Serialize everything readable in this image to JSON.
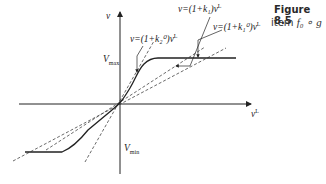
{
  "figure": {
    "title": "Figure 8.5",
    "subtitle_prefix": "item",
    "subtitle_expr": "f₀ ∘ g"
  },
  "axes": {
    "y_label": "v",
    "x_label": "v",
    "x_label_sup": "L",
    "vmax_label": "V",
    "vmax_sub": "max",
    "vmin_label": "V",
    "vmin_sub": "min"
  },
  "annotations": [
    {
      "id": "k1",
      "text": "v=(1+k₁)v",
      "sup": "L"
    },
    {
      "id": "k1_0",
      "text": "v=(1+k₁⁰)v",
      "sup": "L"
    },
    {
      "id": "k2_0",
      "text": "v=(1+k₂⁰)v",
      "sup": "L"
    }
  ],
  "colors": {
    "line": "#222222",
    "dashed": "#444444"
  }
}
